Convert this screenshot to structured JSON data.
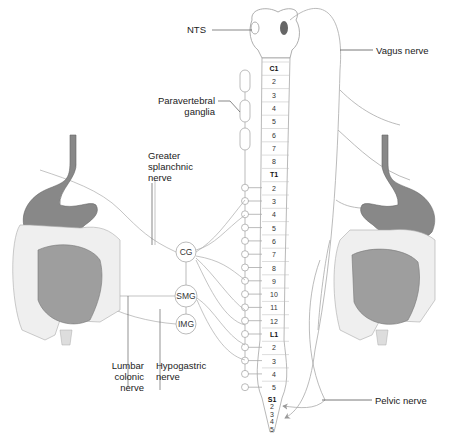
{
  "diagram": {
    "title_partial": "...y pathways ... the ... y",
    "labels": {
      "nts": "NTS",
      "vagus": "Vagus nerve",
      "paravertebral_1": "Paravertebral",
      "paravertebral_2": "ganglia",
      "greater_1": "Greater",
      "greater_2": "splanchnic",
      "greater_3": "nerve",
      "lumbar_1": "Lumbar",
      "lumbar_2": "colonic",
      "lumbar_3": "nerve",
      "hypogastric_1": "Hypogastric",
      "hypogastric_2": "nerve",
      "pelvic": "Pelvic nerve"
    },
    "ganglia": {
      "cg": "CG",
      "smg": "SMG",
      "img": "IMG"
    },
    "spinal_segments": {
      "cervical": [
        "C1",
        "2",
        "3",
        "4",
        "5",
        "6",
        "7",
        "8"
      ],
      "thoracic": [
        "T1",
        "2",
        "3",
        "4",
        "5",
        "6",
        "7",
        "8",
        "9",
        "10",
        "11",
        "12"
      ],
      "lumbar": [
        "L1",
        "2",
        "3",
        "4",
        "5"
      ],
      "sacral": [
        "S1",
        "2",
        "3",
        "4",
        "5"
      ]
    },
    "colors": {
      "line": "#9a9a9a",
      "stomach": "#8a8a8a",
      "intestine": "#a0a0a0",
      "colon": "#eeeeee",
      "text": "#222222"
    }
  }
}
